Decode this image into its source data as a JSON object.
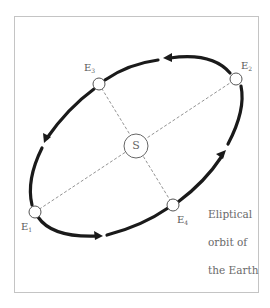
{
  "diagram": {
    "caption_lines": [
      "Eliptical",
      "orbit of",
      "the Earth"
    ],
    "sun": {
      "label": "S",
      "cx": 136,
      "cy": 146,
      "r": 12
    },
    "earth_positions": [
      {
        "id": "E1",
        "base": "E",
        "sub": "1",
        "cx": 35,
        "cy": 212
      },
      {
        "id": "E2",
        "base": "E",
        "sub": "2",
        "cx": 236,
        "cy": 79
      },
      {
        "id": "E3",
        "base": "E",
        "sub": "3",
        "cx": 99,
        "cy": 84
      },
      {
        "id": "E4",
        "base": "E",
        "sub": "4",
        "cx": 173,
        "cy": 205
      }
    ],
    "orbit_direction": "counter-clockwise (E1 → E4 → E2 → E3 → E1)",
    "colors": {
      "orbit": "#1a1a1a",
      "axes": "#777777",
      "frame": "#c4c4c4",
      "text": "#5a5a5a"
    }
  }
}
